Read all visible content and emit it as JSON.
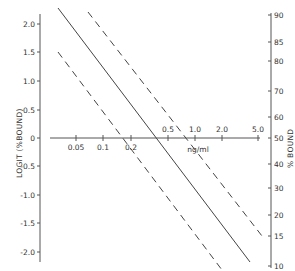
{
  "chart_data": {
    "type": "line",
    "title": "",
    "xlabel": "ng/ml",
    "ylabel": "LOGIT (%BOUND)",
    "ylabel_right": "% BOUND",
    "x_scale": "log",
    "x_ticks": [
      "0.05",
      "0.1",
      "0.2",
      "0.5",
      "1.0",
      "2.0",
      "5.0"
    ],
    "y_ticks": [
      "2.0",
      "1.5",
      "1.0",
      "0.5",
      "0",
      "-0.5",
      "-1.0",
      "-1.5",
      "-2.0"
    ],
    "y_right_ticks": [
      "90",
      "85",
      "80",
      "70",
      "60",
      "50",
      "40",
      "30",
      "20",
      "15",
      "10"
    ],
    "ylim": [
      -2.2,
      2.2
    ],
    "grid": false,
    "legend": null,
    "series": [
      {
        "name": "standard curve (fit)",
        "style": "solid",
        "x": [
          0.025,
          5.0
        ],
        "y": [
          2.2,
          -2.2
        ]
      },
      {
        "name": "upper confidence limit",
        "style": "dashed",
        "x": [
          0.055,
          5.0
        ],
        "y": [
          2.2,
          -1.5
        ]
      },
      {
        "name": "lower confidence limit",
        "style": "dashed",
        "x": [
          0.025,
          1.8
        ],
        "y": [
          1.5,
          -2.2
        ]
      }
    ]
  },
  "labels": {
    "left_axis_title": "LOGIT (%BOUND)",
    "right_axis_title": "% BOUND",
    "x_axis_unit": "ng/ml"
  },
  "left_ticks": [
    {
      "label": "2.0",
      "y": 24
    },
    {
      "label": "1.5",
      "y": 52
    },
    {
      "label": "1.0",
      "y": 81
    },
    {
      "label": "0.5",
      "y": 110
    },
    {
      "label": "0",
      "y": 138
    },
    {
      "label": "-0.5",
      "y": 166
    },
    {
      "label": "-1.0",
      "y": 195
    },
    {
      "label": "-1.5",
      "y": 223
    },
    {
      "label": "-2.0",
      "y": 252
    }
  ],
  "right_ticks": [
    {
      "label": "90",
      "y": 15
    },
    {
      "label": "85",
      "y": 42
    },
    {
      "label": "80",
      "y": 61
    },
    {
      "label": "70",
      "y": 91
    },
    {
      "label": "60",
      "y": 117
    },
    {
      "label": "50",
      "y": 138
    },
    {
      "label": "40",
      "y": 164
    },
    {
      "label": "30",
      "y": 188
    },
    {
      "label": "20",
      "y": 215
    },
    {
      "label": "15",
      "y": 236
    },
    {
      "label": "10",
      "y": 266
    }
  ],
  "x_ticks": [
    {
      "label": "0.05",
      "x": 76,
      "pos": "below"
    },
    {
      "label": "0.1",
      "x": 103,
      "pos": "below"
    },
    {
      "label": "0.2",
      "x": 131,
      "pos": "below"
    },
    {
      "label": "0.5",
      "x": 168,
      "pos": "above"
    },
    {
      "label": "1.0",
      "x": 195,
      "pos": "above"
    },
    {
      "label": "2.0",
      "x": 222,
      "pos": "above"
    },
    {
      "label": "5.0",
      "x": 258,
      "pos": "above"
    }
  ]
}
